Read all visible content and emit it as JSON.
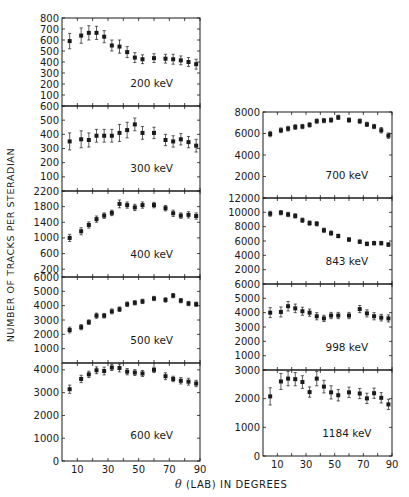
{
  "chart_data": {
    "type": "scatter",
    "title": "",
    "xlabel_symbol": "θ",
    "xlabel": "(LAB)  IN DEGREES",
    "ylabel": "NUMBER OF TRACKS PER STERADIAN",
    "x_ticks": [
      10,
      30,
      50,
      70,
      90
    ],
    "xlim": [
      0,
      90
    ],
    "x": [
      5,
      12.5,
      17.5,
      22.5,
      27.5,
      32.5,
      37.5,
      42.5,
      47.5,
      52.5,
      60,
      67.5,
      72.5,
      77.5,
      82.5,
      87.5
    ],
    "panels": [
      {
        "column": "left",
        "label": "200 keV",
        "ylim": [
          0,
          800
        ],
        "y_ticks": [
          100,
          200,
          300,
          400,
          500,
          600,
          700,
          800
        ],
        "values": [
          590,
          640,
          665,
          665,
          630,
          550,
          540,
          490,
          440,
          425,
          435,
          430,
          425,
          415,
          400,
          380
        ],
        "errors": [
          70,
          70,
          65,
          60,
          55,
          50,
          60,
          50,
          45,
          40,
          40,
          40,
          45,
          40,
          40,
          45
        ]
      },
      {
        "column": "left",
        "label": "300 keV",
        "ylim": [
          0,
          600
        ],
        "y_ticks": [
          100,
          200,
          300,
          400,
          500,
          600
        ],
        "values": [
          350,
          365,
          360,
          390,
          390,
          390,
          410,
          430,
          470,
          410,
          410,
          360,
          350,
          365,
          345,
          320
        ],
        "errors": [
          60,
          60,
          50,
          45,
          45,
          45,
          60,
          55,
          45,
          45,
          40,
          40,
          40,
          40,
          40,
          45
        ]
      },
      {
        "column": "left",
        "label": "400 keV",
        "ylim": [
          0,
          2200
        ],
        "y_ticks": [
          200,
          600,
          1000,
          1400,
          1800,
          2200
        ],
        "values": [
          1000,
          1170,
          1330,
          1480,
          1570,
          1640,
          1870,
          1840,
          1780,
          1840,
          1840,
          1760,
          1630,
          1570,
          1590,
          1560
        ],
        "errors": [
          90,
          90,
          80,
          80,
          70,
          70,
          100,
          80,
          80,
          80,
          70,
          70,
          80,
          70,
          80,
          80
        ]
      },
      {
        "column": "left",
        "label": "500 keV",
        "ylim": [
          0,
          6000
        ],
        "y_ticks": [
          1000,
          2000,
          3000,
          4000,
          5000,
          6000
        ],
        "values": [
          2300,
          2500,
          2850,
          3300,
          3300,
          3600,
          3750,
          4100,
          4200,
          4300,
          4500,
          4400,
          4700,
          4350,
          4150,
          4100
        ],
        "errors": [
          200,
          180,
          160,
          180,
          160,
          170,
          160,
          160,
          150,
          150,
          150,
          150,
          150,
          150,
          150,
          150
        ]
      },
      {
        "column": "left",
        "label": "600 keV",
        "ylim": [
          0,
          4300
        ],
        "y_ticks": [
          0,
          1000,
          2000,
          3000,
          4000
        ],
        "values": [
          3150,
          3600,
          3800,
          3980,
          3950,
          4100,
          4080,
          3920,
          3880,
          3840,
          4000,
          3720,
          3600,
          3520,
          3480,
          3400
        ],
        "errors": [
          180,
          160,
          140,
          150,
          170,
          130,
          170,
          140,
          130,
          130,
          120,
          150,
          120,
          140,
          150,
          140
        ]
      },
      {
        "column": "right",
        "label": "700 keV",
        "ylim": [
          0,
          8000
        ],
        "y_ticks": [
          2000,
          4000,
          6000,
          8000
        ],
        "values": [
          5950,
          6300,
          6450,
          6600,
          6650,
          6800,
          7150,
          7200,
          7250,
          7500,
          7250,
          7150,
          6850,
          6650,
          6300,
          5800
        ],
        "errors": [
          250,
          220,
          220,
          220,
          200,
          200,
          200,
          200,
          200,
          200,
          200,
          200,
          200,
          200,
          250,
          250
        ]
      },
      {
        "column": "right",
        "label": "843 keV",
        "ylim": [
          0,
          12000
        ],
        "y_ticks": [
          2000,
          4000,
          6000,
          8000,
          10000,
          12000
        ],
        "values": [
          9800,
          9950,
          9700,
          9500,
          8900,
          8500,
          8400,
          7500,
          7100,
          6700,
          6200,
          5900,
          5600,
          5700,
          5700,
          5500
        ],
        "errors": [
          350,
          300,
          300,
          300,
          300,
          300,
          300,
          300,
          300,
          250,
          250,
          250,
          250,
          250,
          250,
          250
        ]
      },
      {
        "column": "right",
        "label": "998 keV",
        "ylim": [
          0,
          6000
        ],
        "y_ticks": [
          1000,
          2000,
          3000,
          4000,
          5000,
          6000
        ],
        "values": [
          4000,
          4050,
          4450,
          4300,
          4100,
          4000,
          3750,
          3600,
          3800,
          3800,
          3800,
          4250,
          3950,
          3750,
          3650,
          3600
        ],
        "errors": [
          350,
          350,
          330,
          300,
          280,
          250,
          250,
          220,
          220,
          220,
          220,
          250,
          250,
          250,
          230,
          250
        ]
      },
      {
        "column": "right",
        "label": "1184 keV",
        "ylim": [
          0,
          3000
        ],
        "y_ticks": [
          0,
          1000,
          2000,
          3000
        ],
        "values": [
          2080,
          2600,
          2700,
          2680,
          2580,
          2230,
          2700,
          2420,
          2220,
          2120,
          2220,
          2180,
          2010,
          2190,
          2030,
          1800
        ],
        "errors": [
          300,
          280,
          250,
          230,
          220,
          180,
          250,
          220,
          230,
          200,
          180,
          180,
          180,
          180,
          180,
          180
        ]
      }
    ],
    "layout": {
      "left_column": {
        "x0": 62,
        "x1": 200,
        "panel_tops": [
          18,
          106,
          191,
          277,
          363
        ],
        "bottom": 461
      },
      "right_column": {
        "x0": 263,
        "x1": 392,
        "panel_tops": [
          112,
          198,
          284,
          370
        ],
        "bottom": 456
      },
      "grid": false,
      "legend": "none",
      "ink_color": "#1a1a1a"
    }
  },
  "labels": {
    "ylabel": "NUMBER OF TRACKS PER STERADIAN",
    "xlabel_symbol": "θ",
    "xlabel_rest": " (LAB)  IN DEGREES"
  }
}
